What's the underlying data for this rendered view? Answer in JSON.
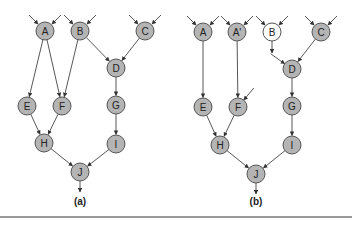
{
  "diagram": {
    "node_radius": 9,
    "colors": {
      "node_fill": "#b4b4b4",
      "node_fill_highlight": "#ffffff",
      "edge": "#444444",
      "rule": "#9a9a9a"
    },
    "panels": [
      {
        "id": "a",
        "caption": "(a)",
        "caption_pos": [
          80,
          205
        ],
        "nodes": [
          {
            "id": "A",
            "label": "A",
            "x": 45,
            "y": 31,
            "fill": "gray",
            "inputs": 2
          },
          {
            "id": "B",
            "label": "B",
            "x": 80,
            "y": 31,
            "fill": "gray",
            "inputs": 2
          },
          {
            "id": "C",
            "label": "C",
            "x": 145,
            "y": 31,
            "fill": "gray",
            "inputs": 2
          },
          {
            "id": "D",
            "label": "D",
            "x": 116,
            "y": 68,
            "fill": "gray"
          },
          {
            "id": "E",
            "label": "E",
            "x": 27,
            "y": 106,
            "fill": "gray"
          },
          {
            "id": "F",
            "label": "F",
            "x": 62,
            "y": 106,
            "fill": "gray"
          },
          {
            "id": "G",
            "label": "G",
            "x": 116,
            "y": 105,
            "fill": "gray"
          },
          {
            "id": "H",
            "label": "H",
            "x": 44,
            "y": 143,
            "fill": "gray"
          },
          {
            "id": "I",
            "label": "I",
            "x": 116,
            "y": 144,
            "fill": "gray"
          },
          {
            "id": "J",
            "label": "J",
            "x": 80,
            "y": 172,
            "fill": "gray",
            "output": true
          }
        ],
        "edges": [
          [
            "A",
            "E"
          ],
          [
            "A",
            "F"
          ],
          [
            "B",
            "F"
          ],
          [
            "B",
            "D"
          ],
          [
            "C",
            "D"
          ],
          [
            "D",
            "G"
          ],
          [
            "E",
            "H"
          ],
          [
            "F",
            "H"
          ],
          [
            "G",
            "I"
          ],
          [
            "H",
            "J"
          ],
          [
            "I",
            "J"
          ]
        ],
        "dangling_inputs": [],
        "dangling_outputs": []
      },
      {
        "id": "b",
        "caption": "(b)",
        "caption_pos": [
          256,
          205
        ],
        "nodes": [
          {
            "id": "A",
            "label": "A",
            "x": 203,
            "y": 32,
            "fill": "gray",
            "inputs": 2
          },
          {
            "id": "A2",
            "label": "A'",
            "x": 237,
            "y": 32,
            "fill": "gray",
            "inputs": 2
          },
          {
            "id": "B",
            "label": "B",
            "x": 272,
            "y": 32,
            "fill": "white",
            "inputs": 2
          },
          {
            "id": "C",
            "label": "C",
            "x": 321,
            "y": 32,
            "fill": "gray",
            "inputs": 2
          },
          {
            "id": "D",
            "label": "D",
            "x": 292,
            "y": 69,
            "fill": "gray"
          },
          {
            "id": "E",
            "label": "E",
            "x": 203,
            "y": 107,
            "fill": "gray"
          },
          {
            "id": "F",
            "label": "F",
            "x": 238,
            "y": 107,
            "fill": "gray"
          },
          {
            "id": "G",
            "label": "G",
            "x": 292,
            "y": 106,
            "fill": "gray"
          },
          {
            "id": "H",
            "label": "H",
            "x": 220,
            "y": 145,
            "fill": "gray"
          },
          {
            "id": "I",
            "label": "I",
            "x": 292,
            "y": 145,
            "fill": "gray"
          },
          {
            "id": "J",
            "label": "J",
            "x": 256,
            "y": 174,
            "fill": "gray",
            "output": true
          }
        ],
        "edges": [
          [
            "A",
            "E"
          ],
          [
            "A2",
            "F"
          ],
          [
            "C",
            "D"
          ],
          [
            "D",
            "G"
          ],
          [
            "E",
            "H"
          ],
          [
            "F",
            "H"
          ],
          [
            "G",
            "I"
          ],
          [
            "H",
            "J"
          ],
          [
            "I",
            "J"
          ]
        ],
        "dangling_inputs": [
          {
            "to": "D",
            "dx": -14,
            "dy": -10
          },
          {
            "to": "F",
            "dx": 10,
            "dy": -12
          }
        ],
        "dangling_outputs": [
          {
            "from": "B",
            "dx": 0,
            "dy": 12
          }
        ]
      }
    ]
  }
}
